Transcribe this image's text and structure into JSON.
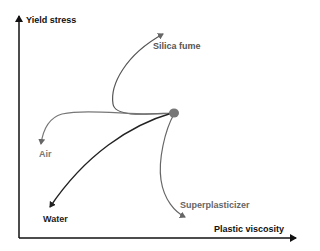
{
  "diagram": {
    "axes": {
      "y_label": "Yield stress",
      "x_label": "Plastic viscosity"
    },
    "center_node": "reference mix",
    "effects": [
      {
        "label": "Silica fume",
        "color": "#555555"
      },
      {
        "label": "Air",
        "color": "#777777"
      },
      {
        "label": "Water",
        "color": "#222222"
      },
      {
        "label": "Superplasticizer",
        "color": "#666666"
      }
    ],
    "colors": {
      "axis": "#111111",
      "node": "#777777"
    }
  }
}
